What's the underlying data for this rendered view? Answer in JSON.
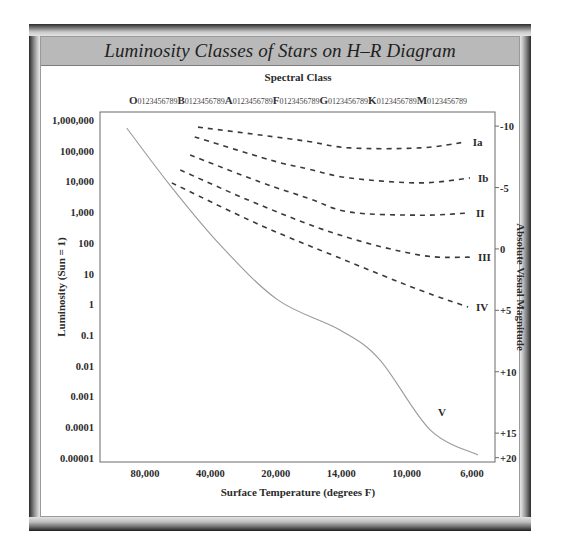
{
  "chart_data": {
    "type": "line",
    "title": "Luminosity Classes of Stars on H–R Diagram",
    "top_axis": {
      "title": "Spectral Class",
      "classes": [
        "O",
        "B",
        "A",
        "F",
        "G",
        "K",
        "M"
      ],
      "subdivisions": "0123456789"
    },
    "x_axis": {
      "title": "Surface Temperature (degrees F)",
      "scale": "categorical-positions",
      "ticks": [
        "80,000",
        "40,000",
        "20,000",
        "14,000",
        "10,000",
        "6,000"
      ],
      "range_index": [
        -0.7,
        5.35
      ]
    },
    "y_axis_left": {
      "title": "Luminosity (Sun = 1)",
      "scale": "log10",
      "ticks": [
        "1,000,000",
        "100,000",
        "10,000",
        "1,000",
        "100",
        "10",
        "1",
        "0.1",
        "0.01",
        "0.001",
        "0.0001",
        "0.00001"
      ],
      "tick_log_values": [
        6,
        5,
        4,
        3,
        2,
        1,
        0,
        -1,
        -2,
        -3,
        -4,
        -5
      ],
      "range_log": [
        -5.1,
        6.3
      ]
    },
    "y_axis_right": {
      "title": "Absolute Visual Magnitude",
      "ticks": [
        {
          "label": "-10",
          "log_position": 5.8
        },
        {
          "label": "-5",
          "log_position": 3.8
        },
        {
          "label": "0",
          "log_position": 1.8
        },
        {
          "label": "+5",
          "log_position": -0.2
        },
        {
          "label": "+10",
          "log_position": -2.2
        },
        {
          "label": "+15",
          "log_position": -4.2
        },
        {
          "label": "+20",
          "log_position": -5.0
        }
      ]
    },
    "grid": false,
    "series": [
      {
        "name": "Ia",
        "style": "dashed",
        "x_index": [
          0.81,
          1.76,
          2.5,
          3.13,
          4.2,
          4.89
        ],
        "log_luminosity": [
          5.77,
          5.51,
          5.3,
          5.09,
          5.09,
          5.28
        ]
      },
      {
        "name": "Ib",
        "style": "dashed",
        "x_index": [
          0.76,
          1.91,
          2.5,
          3.13,
          4.2,
          4.97
        ],
        "log_luminosity": [
          5.45,
          4.7,
          4.4,
          4.11,
          3.95,
          4.11
        ]
      },
      {
        "name": "II",
        "style": "dashed",
        "x_index": [
          0.69,
          1.76,
          2.5,
          3.13,
          4.2,
          4.94
        ],
        "log_luminosity": [
          4.86,
          3.98,
          3.45,
          3.0,
          2.9,
          2.97
        ]
      },
      {
        "name": "III",
        "style": "dashed",
        "x_index": [
          0.54,
          1.76,
          2.98,
          4.2,
          4.97
        ],
        "log_luminosity": [
          4.37,
          3.23,
          2.25,
          1.6,
          1.53
        ]
      },
      {
        "name": "IV",
        "style": "dashed",
        "x_index": [
          0.41,
          1.76,
          2.98,
          4.2,
          4.94
        ],
        "log_luminosity": [
          3.95,
          2.58,
          1.5,
          0.46,
          -0.09
        ]
      },
      {
        "name": "V",
        "style": "solid",
        "x_index": [
          -0.28,
          0.38,
          1.15,
          2.03,
          2.98,
          3.59,
          4.36,
          5.09
        ],
        "log_luminosity": [
          5.74,
          3.88,
          1.93,
          0.14,
          -0.84,
          -1.81,
          -4.09,
          -4.91
        ]
      }
    ]
  }
}
